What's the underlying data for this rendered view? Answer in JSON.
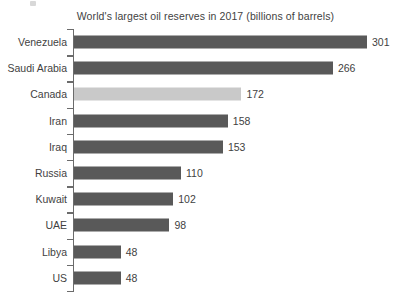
{
  "chart_data": {
    "type": "bar",
    "orientation": "horizontal",
    "title": "World's largest oil reserves in 2017 (billions of barrels)",
    "xlabel": "",
    "ylabel": "",
    "categories": [
      "Venezuela",
      "Saudi Arabia",
      "Canada",
      "Iran",
      "Iraq",
      "Russia",
      "Kuwait",
      "UAE",
      "Libya",
      "US"
    ],
    "values": [
      301,
      266,
      172,
      158,
      153,
      110,
      102,
      98,
      48,
      48
    ],
    "value_labels": [
      "301",
      "266",
      "172",
      "158",
      "153",
      "110",
      "102",
      "98",
      "48",
      "48"
    ],
    "xlim": [
      0,
      301
    ],
    "grid": false,
    "legend": false,
    "highlighted_category": "Canada",
    "bar_color": "#595959",
    "highlight_color": "#c9c9c9",
    "axis_color": "#6b6b6b",
    "text_color": "#3f3f3f",
    "background_color": "#ffffff"
  }
}
